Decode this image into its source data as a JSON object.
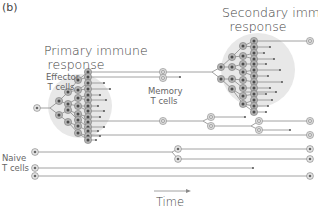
{
  "panel_label": "(b)",
  "labels": {
    "primary_line1": "Primary immune",
    "primary_line2": "response",
    "secondary_line1": "Secondary immune",
    "secondary_line2": "response",
    "effector_line1": "Effector",
    "effector_line2": "T cells",
    "memory_line1": "Memory",
    "memory_line2": "T cells",
    "naive_line1": "Naive",
    "naive_line2": "T cells",
    "time": "Time"
  },
  "colors": {
    "cluster_bg": "#e6e6e6",
    "line": "#8a8a8a",
    "cell_fill": "#b0b0b0",
    "cell_core": "#555555",
    "memory_fill": "#d4d4d4"
  }
}
